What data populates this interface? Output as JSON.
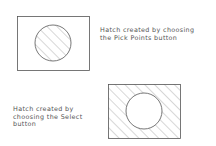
{
  "figure1": {
    "caption_lines": [
      "Hatch created by choosing",
      "the Pick Points button"
    ],
    "hatched_region": "circle"
  },
  "figure2": {
    "caption_lines": [
      "Hatch created by",
      "choosing the Select",
      "button"
    ],
    "hatched_region": "rectangle-excluding-circle"
  },
  "colors": {
    "line": "#555555",
    "hatch": "#777777",
    "background": "#ffffff"
  }
}
